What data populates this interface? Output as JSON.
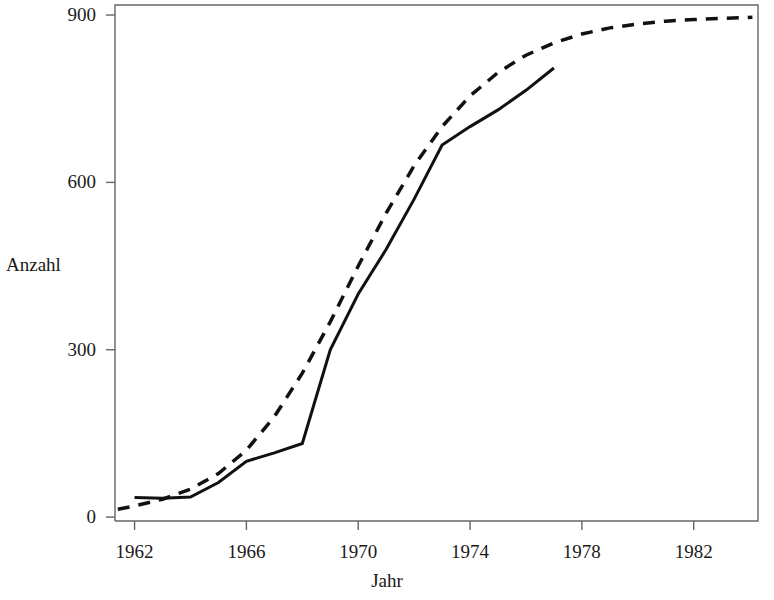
{
  "figure": {
    "background_color": "#ffffff",
    "line_color": "#111111",
    "frame_color": "#5a5a5a"
  },
  "chart_data": {
    "type": "line",
    "title": "",
    "subtitle": "",
    "xlabel": "Jahr",
    "ylabel": "Anzahl",
    "xlim": [
      1961.3,
      1984.3
    ],
    "ylim": [
      -7,
      918
    ],
    "grid": false,
    "legend": null,
    "legend_position": "none",
    "x_ticks": [
      1962,
      1966,
      1970,
      1974,
      1978,
      1982
    ],
    "x_tick_labels": [
      "1962",
      "1966",
      "1970",
      "1974",
      "1978",
      "1982"
    ],
    "y_ticks": [
      0,
      300,
      600,
      900
    ],
    "y_tick_labels": [
      "0",
      "300",
      "600",
      "900"
    ],
    "series": [
      {
        "name": "Beobachtete Anzahl",
        "style": "solid",
        "color": "#111111",
        "width": 3,
        "x": [
          1962,
          1963,
          1964,
          1965,
          1966,
          1967,
          1968,
          1969,
          1970,
          1971,
          1972,
          1973,
          1974,
          1975,
          1976,
          1977
        ],
        "values": [
          35,
          34,
          36,
          62,
          100,
          115,
          132,
          300,
          400,
          480,
          570,
          667,
          700,
          730,
          765,
          805
        ]
      },
      {
        "name": "Logistische Anpassung",
        "style": "dashed",
        "color": "#111111",
        "width": 3.5,
        "dash_pattern": "12 9",
        "x": [
          1961.4,
          1962,
          1963,
          1964,
          1965,
          1966,
          1967,
          1968,
          1969,
          1970,
          1971,
          1972,
          1973,
          1974,
          1975,
          1976,
          1977,
          1978,
          1979,
          1980,
          1981,
          1982,
          1983,
          1984.1
        ],
        "values": [
          14,
          20,
          32,
          50,
          78,
          120,
          180,
          258,
          350,
          450,
          545,
          630,
          700,
          755,
          797,
          828,
          850,
          866,
          877,
          884,
          889,
          892,
          894,
          896
        ]
      }
    ]
  },
  "axes": {
    "x_title": "Jahr",
    "y_title": "Anzahl"
  }
}
